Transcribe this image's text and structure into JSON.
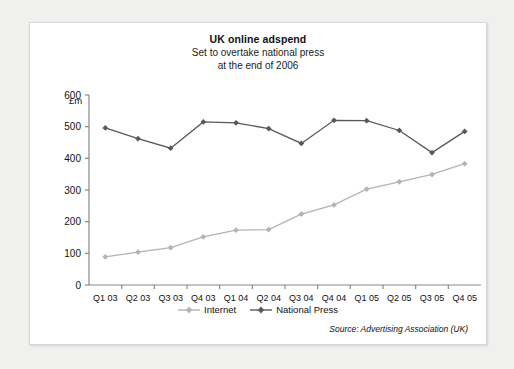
{
  "card": {
    "title": "UK online adspend",
    "subtitle_line1": "Set to overtake national press",
    "subtitle_line2": "at the end of 2006",
    "unit": "£m",
    "source": "Source: Advertising Association (UK)"
  },
  "legend": {
    "items": [
      {
        "label": "Internet",
        "color": "#b3b3b3"
      },
      {
        "label": "National Press",
        "color": "#595959"
      }
    ]
  },
  "chart_data": {
    "type": "line",
    "title": "UK online adspend",
    "subtitle": "Set to overtake national press at the end of 2006",
    "xlabel": "",
    "ylabel": "£m",
    "ylim": [
      0,
      600
    ],
    "yticks": [
      0,
      100,
      200,
      300,
      400,
      500,
      600
    ],
    "grid": false,
    "legend_position": "bottom",
    "categories": [
      "Q1 03",
      "Q2 03",
      "Q3 03",
      "Q4 03",
      "Q1 04",
      "Q2 04",
      "Q3 04",
      "Q4 04",
      "Q1 05",
      "Q2 05",
      "Q3 05",
      "Q4 05"
    ],
    "series": [
      {
        "name": "Internet",
        "color": "#b3b3b3",
        "values": [
          89,
          104,
          118,
          152,
          173,
          175,
          224,
          253,
          303,
          326,
          349,
          383
        ]
      },
      {
        "name": "National Press",
        "color": "#595959",
        "values": [
          496,
          462,
          432,
          515,
          512,
          494,
          447,
          520,
          519,
          488,
          418,
          485
        ]
      }
    ]
  }
}
